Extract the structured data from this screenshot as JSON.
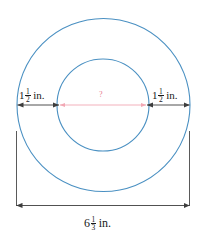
{
  "figure": {
    "colors": {
      "circle_stroke": "#4a90c2",
      "dimension_line": "#3d3d3d",
      "diameter_line": "#f2a8b4",
      "unknown_label": "#e87b8e",
      "background": "#ffffff"
    },
    "labels": {
      "left_band": {
        "whole": "1",
        "numerator": "1",
        "denominator": "2",
        "unit": "in.",
        "full_text": "1 1/2 in."
      },
      "right_band": {
        "whole": "1",
        "numerator": "1",
        "denominator": "2",
        "unit": "in.",
        "full_text": "1 1/2 in."
      },
      "outer_diameter": {
        "whole": "6",
        "numerator": "1",
        "denominator": "3",
        "unit": "in.",
        "full_text": "6 1/3 in."
      },
      "inner_diameter": {
        "text": "?"
      }
    },
    "geometry": {
      "outer_circle": {
        "cx": 103.5,
        "cy": 105,
        "r": 86.5
      },
      "inner_circle": {
        "cx": 103,
        "cy": 105,
        "r": 46
      },
      "dimension_line_y": 105,
      "bracket": {
        "x1": 16,
        "x2": 190,
        "top_y": 131,
        "bottom_y": 206
      }
    }
  }
}
